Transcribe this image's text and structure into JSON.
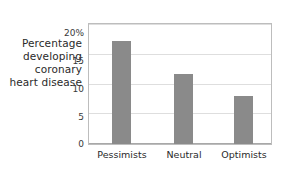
{
  "chart_data": {
    "type": "bar",
    "title": "",
    "xlabel": "",
    "ylabel": "Percentage developing coronary heart disease",
    "ylabel_lines": [
      "Percentage",
      "developing",
      "coronary",
      "heart disease"
    ],
    "categories": [
      "Pessimists",
      "Neutral",
      "Optimists"
    ],
    "values": [
      17.3,
      11.8,
      8.0
    ],
    "ylim": [
      0,
      20
    ],
    "ytick_labels": [
      "20%",
      "15",
      "10",
      "5",
      "0"
    ],
    "ytick_values": [
      20,
      15,
      10,
      5,
      0
    ],
    "grid": true,
    "legend": "none",
    "bar_color": "#8a8a8a",
    "grid_color": "#dedede",
    "frame_color": "#bdbdbd",
    "text_color": "#2a2a2a"
  }
}
